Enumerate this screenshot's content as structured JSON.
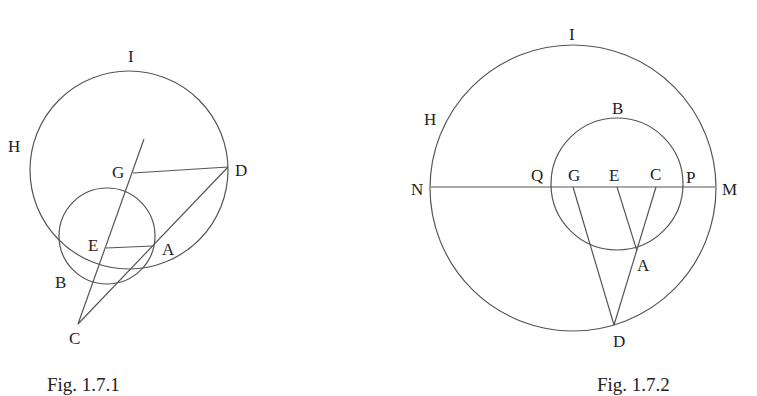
{
  "figures": [
    {
      "caption": "Fig. 1.7.1",
      "labels": {
        "I": "I",
        "H": "H",
        "G": "G",
        "D": "D",
        "E": "E",
        "A": "A",
        "B": "B",
        "C": "C"
      }
    },
    {
      "caption": "Fig. 1.7.2",
      "labels": {
        "I": "I",
        "H": "H",
        "B": "B",
        "N": "N",
        "Q": "Q",
        "G": "G",
        "E": "E",
        "C": "C",
        "P": "P",
        "M": "M",
        "A": "A",
        "D": "D"
      }
    }
  ],
  "colors": {
    "line": "#555555",
    "text": "#222222",
    "background": "#ffffff"
  }
}
